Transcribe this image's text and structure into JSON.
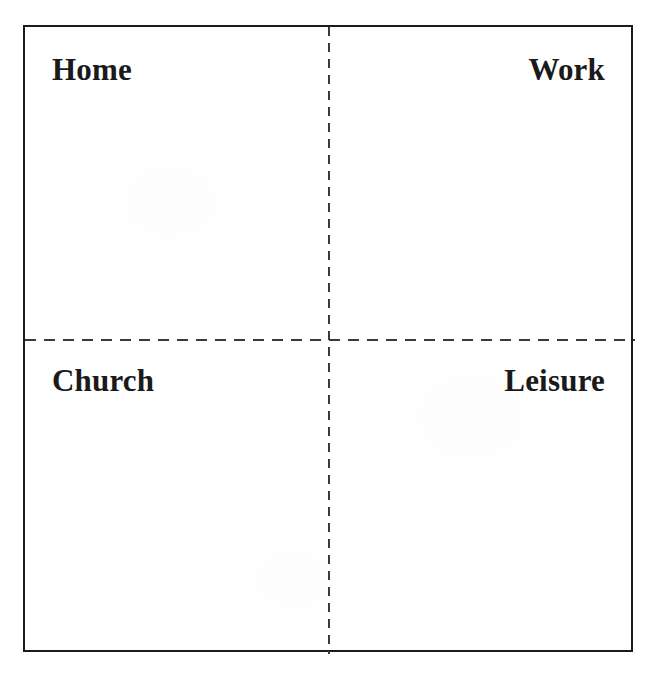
{
  "document": {
    "kind": "quadrant-diagram",
    "background_color": "#ffffff",
    "frame_color": "#1b1b1b",
    "divider_color": "#3a3a3a",
    "label_color": "#1a1a1a"
  },
  "chart_data": {
    "type": "table",
    "title": "",
    "subtitle": "",
    "xlabel": "",
    "ylabel": "",
    "grid": false,
    "legend": "none",
    "layout": "2x2 quadrants divided by dashed vertical and horizontal lines",
    "categories": [
      "Home",
      "Work",
      "Church",
      "Leisure"
    ],
    "quadrants": [
      {
        "position": "top-left",
        "label": "Home",
        "align": "left"
      },
      {
        "position": "top-right",
        "label": "Work",
        "align": "right"
      },
      {
        "position": "bottom-left",
        "label": "Church",
        "align": "left"
      },
      {
        "position": "bottom-right",
        "label": "Leisure",
        "align": "right"
      }
    ]
  },
  "quadrants": {
    "top_left": {
      "label": "Home"
    },
    "top_right": {
      "label": "Work"
    },
    "bottom_left": {
      "label": "Church"
    },
    "bottom_right": {
      "label": "Leisure"
    }
  }
}
